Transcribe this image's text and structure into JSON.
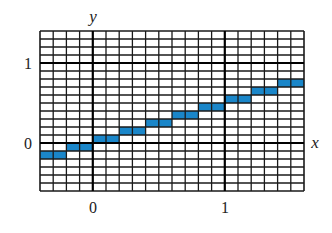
{
  "chart_data": {
    "type": "line",
    "subtype": "step",
    "title": "",
    "xlabel": "x",
    "ylabel": "y",
    "xlim": [
      -0.4,
      1.6
    ],
    "ylim": [
      -0.6,
      1.4
    ],
    "grid": true,
    "grid_minor_step": 0.1,
    "x_ticks": [
      {
        "value": 0,
        "label": "0"
      },
      {
        "value": 1,
        "label": "1"
      }
    ],
    "y_ticks": [
      {
        "value": 0,
        "label": "0"
      },
      {
        "value": 1,
        "label": "1"
      }
    ],
    "series": [
      {
        "name": "step function",
        "color": "#1a86c9",
        "segments": [
          {
            "x0": -0.4,
            "x1": -0.2,
            "y0": -0.2,
            "y1": -0.1
          },
          {
            "x0": -0.2,
            "x1": 0.0,
            "y0": -0.1,
            "y1": 0.0
          },
          {
            "x0": 0.0,
            "x1": 0.2,
            "y0": 0.0,
            "y1": 0.1
          },
          {
            "x0": 0.2,
            "x1": 0.4,
            "y0": 0.1,
            "y1": 0.2
          },
          {
            "x0": 0.4,
            "x1": 0.6,
            "y0": 0.2,
            "y1": 0.3
          },
          {
            "x0": 0.6,
            "x1": 0.8,
            "y0": 0.3,
            "y1": 0.4
          },
          {
            "x0": 0.8,
            "x1": 1.0,
            "y0": 0.4,
            "y1": 0.5
          },
          {
            "x0": 1.0,
            "x1": 1.2,
            "y0": 0.5,
            "y1": 0.6
          },
          {
            "x0": 1.2,
            "x1": 1.4,
            "y0": 0.6,
            "y1": 0.7
          },
          {
            "x0": 1.4,
            "x1": 1.6,
            "y0": 0.7,
            "y1": 0.8
          }
        ]
      }
    ],
    "legend": null
  },
  "labels": {
    "x_axis": "x",
    "y_axis": "y",
    "x_tick_0": "0",
    "x_tick_1": "1",
    "y_tick_0": "0",
    "y_tick_1": "1"
  },
  "colors": {
    "bar": "#1a86c9",
    "grid": "#1a1a1a",
    "axis": "#000000",
    "background": "#ffffff"
  }
}
